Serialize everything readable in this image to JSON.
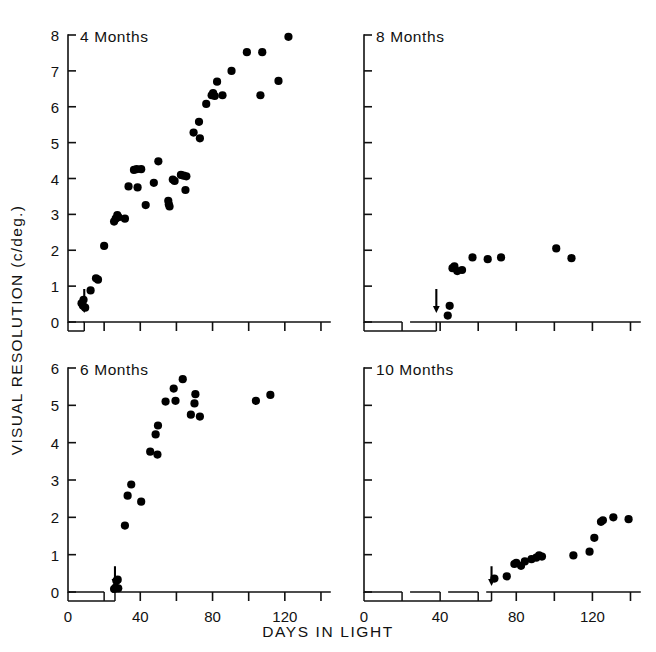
{
  "figure": {
    "x_axis_title": "DAYS IN LIGHT",
    "y_axis_title": "VISUAL RESOLUTION (c/deg.)",
    "x_tick_labels": [
      "0",
      "40",
      "80",
      "120"
    ],
    "y_tick_labels_top": [
      "0",
      "1",
      "2",
      "3",
      "4",
      "5",
      "6",
      "7",
      "8"
    ],
    "y_tick_labels_bottom": [
      "0",
      "1",
      "2",
      "3",
      "4",
      "5",
      "6"
    ],
    "panel_titles": [
      "4 Months",
      "6 Months",
      "8 Months",
      "10 Months"
    ],
    "marker_color": "#000000",
    "axis_color": "#111111"
  },
  "chart_data": [
    {
      "type": "scatter",
      "title": "4 Months",
      "xlabel": "DAYS IN LIGHT",
      "ylabel": "VISUAL RESOLUTION (c/deg.)",
      "xlim": [
        0,
        145
      ],
      "ylim": [
        0,
        8
      ],
      "xticks": [
        0,
        20,
        40,
        60,
        80,
        100,
        120,
        140
      ],
      "yticks": [
        0,
        1,
        2,
        3,
        4,
        5,
        6,
        7,
        8
      ],
      "grid": false,
      "legend": "none",
      "onset_arrow_x": 9,
      "points": [
        {
          "x": 7.5,
          "y": 0.52
        },
        {
          "x": 8.3,
          "y": 0.45
        },
        {
          "x": 8.6,
          "y": 0.62
        },
        {
          "x": 9.5,
          "y": 0.4
        },
        {
          "x": 12.5,
          "y": 0.88
        },
        {
          "x": 15.5,
          "y": 1.22
        },
        {
          "x": 16.6,
          "y": 1.18
        },
        {
          "x": 20.0,
          "y": 2.12
        },
        {
          "x": 25.5,
          "y": 2.8
        },
        {
          "x": 26.4,
          "y": 2.88
        },
        {
          "x": 27.3,
          "y": 2.98
        },
        {
          "x": 28.0,
          "y": 2.92
        },
        {
          "x": 31.5,
          "y": 2.88
        },
        {
          "x": 33.5,
          "y": 3.78
        },
        {
          "x": 36.5,
          "y": 4.24
        },
        {
          "x": 38.0,
          "y": 4.26
        },
        {
          "x": 38.5,
          "y": 3.75
        },
        {
          "x": 40.5,
          "y": 4.26
        },
        {
          "x": 43.0,
          "y": 3.26
        },
        {
          "x": 47.5,
          "y": 3.88
        },
        {
          "x": 50.0,
          "y": 4.48
        },
        {
          "x": 55.5,
          "y": 3.38
        },
        {
          "x": 55.8,
          "y": 3.28
        },
        {
          "x": 56.2,
          "y": 3.22
        },
        {
          "x": 58.0,
          "y": 3.97
        },
        {
          "x": 59.0,
          "y": 3.93
        },
        {
          "x": 62.5,
          "y": 4.1
        },
        {
          "x": 64.0,
          "y": 4.08
        },
        {
          "x": 65.5,
          "y": 4.06
        },
        {
          "x": 65.0,
          "y": 3.68
        },
        {
          "x": 69.5,
          "y": 5.28
        },
        {
          "x": 72.5,
          "y": 5.58
        },
        {
          "x": 73.0,
          "y": 5.12
        },
        {
          "x": 76.5,
          "y": 6.08
        },
        {
          "x": 79.5,
          "y": 6.32
        },
        {
          "x": 80.3,
          "y": 6.38
        },
        {
          "x": 81.2,
          "y": 6.3
        },
        {
          "x": 82.5,
          "y": 6.7
        },
        {
          "x": 85.5,
          "y": 6.32
        },
        {
          "x": 90.5,
          "y": 7.0
        },
        {
          "x": 99.0,
          "y": 7.52
        },
        {
          "x": 106.5,
          "y": 6.32
        },
        {
          "x": 107.5,
          "y": 7.52
        },
        {
          "x": 116.5,
          "y": 6.72
        },
        {
          "x": 122.0,
          "y": 7.95
        }
      ]
    },
    {
      "type": "scatter",
      "title": "6 Months",
      "xlabel": "DAYS IN LIGHT",
      "ylabel": "VISUAL RESOLUTION (c/deg.)",
      "xlim": [
        0,
        145
      ],
      "ylim": [
        0,
        6
      ],
      "xticks": [
        0,
        20,
        40,
        60,
        80,
        100,
        120,
        140
      ],
      "yticks": [
        0,
        1,
        2,
        3,
        4,
        5,
        6
      ],
      "grid": false,
      "legend": "none",
      "onset_arrow_x": 26,
      "points": [
        {
          "x": 25.5,
          "y": 0.08
        },
        {
          "x": 26.3,
          "y": 0.12
        },
        {
          "x": 26.8,
          "y": 0.3
        },
        {
          "x": 27.5,
          "y": 0.33
        },
        {
          "x": 27.8,
          "y": 0.1
        },
        {
          "x": 31.5,
          "y": 1.78
        },
        {
          "x": 33.0,
          "y": 2.58
        },
        {
          "x": 35.0,
          "y": 2.88
        },
        {
          "x": 40.5,
          "y": 2.42
        },
        {
          "x": 45.5,
          "y": 3.76
        },
        {
          "x": 49.5,
          "y": 3.68
        },
        {
          "x": 48.5,
          "y": 4.22
        },
        {
          "x": 49.8,
          "y": 4.46
        },
        {
          "x": 54.0,
          "y": 5.1
        },
        {
          "x": 58.5,
          "y": 5.45
        },
        {
          "x": 59.5,
          "y": 5.12
        },
        {
          "x": 63.5,
          "y": 5.7
        },
        {
          "x": 68.0,
          "y": 4.75
        },
        {
          "x": 70.5,
          "y": 5.3
        },
        {
          "x": 70.0,
          "y": 5.05
        },
        {
          "x": 73.0,
          "y": 4.7
        },
        {
          "x": 104.0,
          "y": 5.12
        },
        {
          "x": 112.0,
          "y": 5.28
        }
      ]
    },
    {
      "type": "scatter",
      "title": "8 Months",
      "xlabel": "DAYS IN LIGHT",
      "ylabel": "VISUAL RESOLUTION (c/deg.)",
      "xlim": [
        0,
        145
      ],
      "ylim": [
        0,
        8
      ],
      "xticks": [
        0,
        20,
        40,
        60,
        80,
        100,
        120,
        140
      ],
      "yticks": [
        0,
        1,
        2,
        3,
        4,
        5,
        6,
        7,
        8
      ],
      "grid": false,
      "legend": "none",
      "onset_arrow_x": 38,
      "points": [
        {
          "x": 44.0,
          "y": 0.18
        },
        {
          "x": 45.0,
          "y": 0.45
        },
        {
          "x": 46.5,
          "y": 1.5
        },
        {
          "x": 47.5,
          "y": 1.55
        },
        {
          "x": 49.0,
          "y": 1.42
        },
        {
          "x": 51.5,
          "y": 1.45
        },
        {
          "x": 57.0,
          "y": 1.8
        },
        {
          "x": 65.0,
          "y": 1.75
        },
        {
          "x": 72.0,
          "y": 1.8
        },
        {
          "x": 101.0,
          "y": 2.05
        },
        {
          "x": 109.0,
          "y": 1.78
        }
      ]
    },
    {
      "type": "scatter",
      "title": "10 Months",
      "xlabel": "DAYS IN LIGHT",
      "ylabel": "VISUAL RESOLUTION (c/deg.)",
      "xlim": [
        0,
        145
      ],
      "ylim": [
        0,
        6
      ],
      "xticks": [
        0,
        20,
        40,
        60,
        80,
        100,
        120,
        140
      ],
      "yticks": [
        0,
        1,
        2,
        3,
        4,
        5,
        6
      ],
      "grid": false,
      "legend": "none",
      "onset_arrow_x": 67,
      "points": [
        {
          "x": 68.5,
          "y": 0.36
        },
        {
          "x": 75.0,
          "y": 0.42
        },
        {
          "x": 79.0,
          "y": 0.75
        },
        {
          "x": 80.0,
          "y": 0.78
        },
        {
          "x": 82.5,
          "y": 0.7
        },
        {
          "x": 84.5,
          "y": 0.82
        },
        {
          "x": 88.0,
          "y": 0.88
        },
        {
          "x": 90.5,
          "y": 0.92
        },
        {
          "x": 92.0,
          "y": 0.98
        },
        {
          "x": 93.5,
          "y": 0.95
        },
        {
          "x": 110.0,
          "y": 0.98
        },
        {
          "x": 118.5,
          "y": 1.08
        },
        {
          "x": 121.0,
          "y": 1.45
        },
        {
          "x": 124.5,
          "y": 1.88
        },
        {
          "x": 125.5,
          "y": 1.92
        },
        {
          "x": 131.0,
          "y": 2.0
        },
        {
          "x": 139.0,
          "y": 1.95
        }
      ]
    }
  ]
}
